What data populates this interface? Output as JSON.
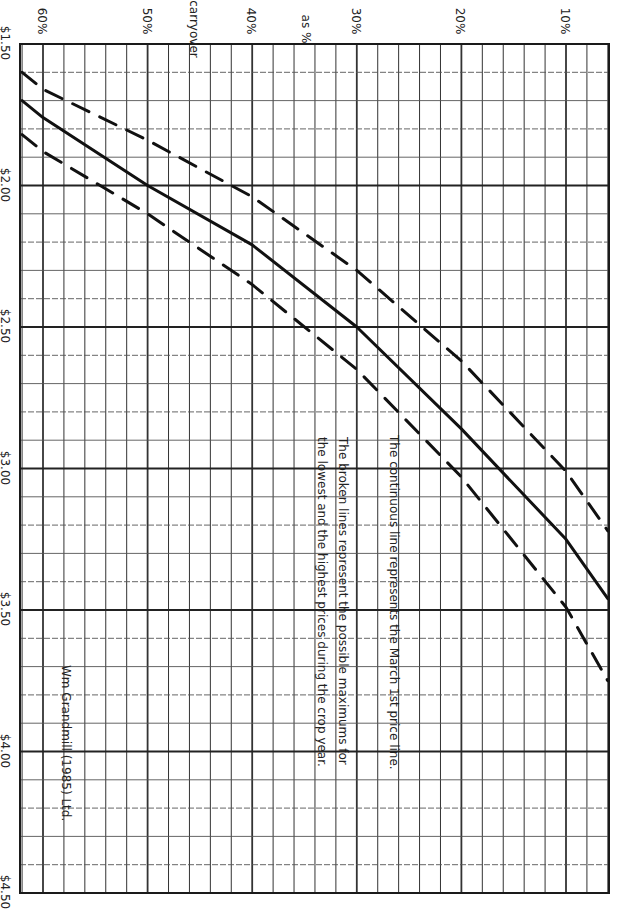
{
  "chart_data": {
    "type": "line",
    "orientation": "rotated 90° clockwise (x-axis across top, y-axis down left side)",
    "title": "",
    "xlabel": "carryover as %",
    "ylabel": "",
    "x_ticks": [
      "60%",
      "50%",
      "40%",
      "30%",
      "20%",
      "10%"
    ],
    "y_ticks": [
      "$1.50",
      "$2.00",
      "$2.50",
      "$3.00",
      "$3.50",
      "$4.00",
      "$4.50"
    ],
    "xlim": [
      62,
      6
    ],
    "ylim": [
      1.5,
      4.5
    ],
    "grid": true,
    "x": [
      62,
      60,
      50,
      40,
      30,
      20,
      10,
      6
    ],
    "series": [
      {
        "name": "March 1st price line",
        "style": "solid",
        "values": [
          1.7,
          1.76,
          2.0,
          2.21,
          2.5,
          2.86,
          3.25,
          3.46
        ]
      },
      {
        "name": "Lowest possible maximum price",
        "style": "dashed",
        "values": [
          1.6,
          1.66,
          1.84,
          2.04,
          2.3,
          2.62,
          3.01,
          3.22
        ]
      },
      {
        "name": "Highest possible maximum price",
        "style": "dashed",
        "values": [
          1.82,
          1.88,
          2.1,
          2.35,
          2.65,
          3.03,
          3.49,
          3.75
        ]
      }
    ],
    "annotations": [
      "The continuous line represents the March 1st price line.",
      "The broken lines represent the possible maximums for",
      "the lowest and the highest prices during the crop year.",
      "Wm Grandmill (1985) Ltd."
    ]
  },
  "labels": {
    "x_axis_word1": "carryover",
    "x_axis_word2": "as %",
    "note_line1": "The continuous line represents the March 1st price line.",
    "note_line2": "The broken lines represent the possible maximums for",
    "note_line3": "the lowest and the highest prices during the crop year.",
    "credit": "Wm Grandmill (1985) Ltd."
  },
  "colors": {
    "ink": "#1a1a1a",
    "grid": "#333333",
    "minor_grid": "#555555",
    "background": "#ffffff"
  }
}
